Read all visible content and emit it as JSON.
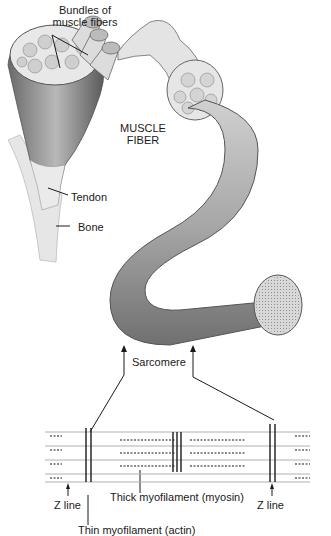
{
  "diagram": {
    "labels": {
      "bundles": [
        "Bundles of",
        "muscle fibers"
      ],
      "muscle_fiber": [
        "MUSCLE",
        "FIBER"
      ],
      "tendon": "Tendon",
      "bone": "Bone",
      "sarcomere": "Sarcomere",
      "z_line_left": "Z line",
      "z_line_right": "Z line",
      "thick": "Thick myofilament (myosin)",
      "thin": "Thin myofilament (actin)"
    },
    "colors": {
      "ink": "#1a1a1a",
      "muscle_dark": "#5a5a5a",
      "muscle_mid": "#9a9a9a",
      "muscle_light": "#d8d8d8",
      "filament": "#b0b0b0"
    }
  }
}
